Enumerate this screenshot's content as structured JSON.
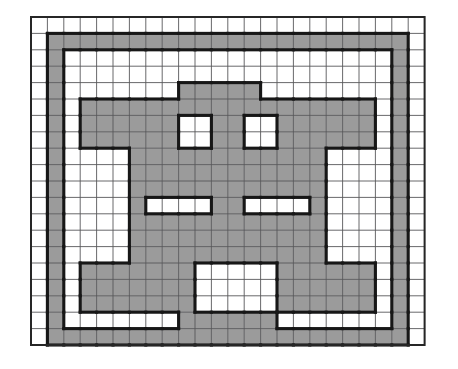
{
  "figure": {
    "type": "grid-shading-puzzle",
    "grid": {
      "columns": 24,
      "rows": 20,
      "cell_size_px": 16.4,
      "origin_x_px": 31,
      "origin_y_px": 17,
      "gridline_color": "#58585a",
      "outer_frame_color": "#262626",
      "outline_color": "#171717",
      "shaded_color": "#9b9b9b",
      "empty_color": "#ffffff",
      "background_color": "#ffffff"
    },
    "shaded_cells": [
      [
        1,
        1
      ],
      [
        2,
        1
      ],
      [
        3,
        1
      ],
      [
        4,
        1
      ],
      [
        5,
        1
      ],
      [
        6,
        1
      ],
      [
        7,
        1
      ],
      [
        8,
        1
      ],
      [
        9,
        1
      ],
      [
        10,
        1
      ],
      [
        11,
        1
      ],
      [
        12,
        1
      ],
      [
        13,
        1
      ],
      [
        14,
        1
      ],
      [
        15,
        1
      ],
      [
        16,
        1
      ],
      [
        17,
        1
      ],
      [
        18,
        1
      ],
      [
        19,
        1
      ],
      [
        20,
        1
      ],
      [
        21,
        1
      ],
      [
        22,
        1
      ],
      [
        1,
        2
      ],
      [
        22,
        2
      ],
      [
        1,
        3
      ],
      [
        22,
        3
      ],
      [
        1,
        4
      ],
      [
        9,
        4
      ],
      [
        10,
        4
      ],
      [
        11,
        4
      ],
      [
        12,
        4
      ],
      [
        13,
        4
      ],
      [
        22,
        4
      ],
      [
        1,
        5
      ],
      [
        3,
        5
      ],
      [
        4,
        5
      ],
      [
        5,
        5
      ],
      [
        6,
        5
      ],
      [
        7,
        5
      ],
      [
        8,
        5
      ],
      [
        9,
        5
      ],
      [
        10,
        5
      ],
      [
        11,
        5
      ],
      [
        12,
        5
      ],
      [
        13,
        5
      ],
      [
        14,
        5
      ],
      [
        15,
        5
      ],
      [
        16,
        5
      ],
      [
        17,
        5
      ],
      [
        18,
        5
      ],
      [
        19,
        5
      ],
      [
        20,
        5
      ],
      [
        22,
        5
      ],
      [
        1,
        6
      ],
      [
        3,
        6
      ],
      [
        4,
        6
      ],
      [
        5,
        6
      ],
      [
        6,
        6
      ],
      [
        7,
        6
      ],
      [
        8,
        6
      ],
      [
        11,
        6
      ],
      [
        12,
        6
      ],
      [
        15,
        6
      ],
      [
        16,
        6
      ],
      [
        17,
        6
      ],
      [
        18,
        6
      ],
      [
        19,
        6
      ],
      [
        20,
        6
      ],
      [
        22,
        6
      ],
      [
        1,
        7
      ],
      [
        3,
        7
      ],
      [
        4,
        7
      ],
      [
        5,
        7
      ],
      [
        6,
        7
      ],
      [
        7,
        7
      ],
      [
        8,
        7
      ],
      [
        11,
        7
      ],
      [
        12,
        7
      ],
      [
        15,
        7
      ],
      [
        16,
        7
      ],
      [
        17,
        7
      ],
      [
        18,
        7
      ],
      [
        19,
        7
      ],
      [
        20,
        7
      ],
      [
        22,
        7
      ],
      [
        1,
        8
      ],
      [
        6,
        8
      ],
      [
        7,
        8
      ],
      [
        8,
        8
      ],
      [
        9,
        8
      ],
      [
        10,
        8
      ],
      [
        11,
        8
      ],
      [
        12,
        8
      ],
      [
        13,
        8
      ],
      [
        14,
        8
      ],
      [
        15,
        8
      ],
      [
        16,
        8
      ],
      [
        17,
        8
      ],
      [
        22,
        8
      ],
      [
        1,
        9
      ],
      [
        6,
        9
      ],
      [
        7,
        9
      ],
      [
        8,
        9
      ],
      [
        9,
        9
      ],
      [
        10,
        9
      ],
      [
        11,
        9
      ],
      [
        12,
        9
      ],
      [
        13,
        9
      ],
      [
        14,
        9
      ],
      [
        15,
        9
      ],
      [
        16,
        9
      ],
      [
        17,
        9
      ],
      [
        22,
        9
      ],
      [
        1,
        10
      ],
      [
        6,
        10
      ],
      [
        7,
        10
      ],
      [
        8,
        10
      ],
      [
        9,
        10
      ],
      [
        10,
        10
      ],
      [
        11,
        10
      ],
      [
        12,
        10
      ],
      [
        13,
        10
      ],
      [
        14,
        10
      ],
      [
        15,
        10
      ],
      [
        16,
        10
      ],
      [
        17,
        10
      ],
      [
        22,
        10
      ],
      [
        1,
        11
      ],
      [
        6,
        11
      ],
      [
        11,
        11
      ],
      [
        12,
        11
      ],
      [
        17,
        11
      ],
      [
        22,
        11
      ],
      [
        1,
        12
      ],
      [
        6,
        12
      ],
      [
        7,
        12
      ],
      [
        8,
        12
      ],
      [
        9,
        12
      ],
      [
        10,
        12
      ],
      [
        11,
        12
      ],
      [
        12,
        12
      ],
      [
        13,
        12
      ],
      [
        14,
        12
      ],
      [
        15,
        12
      ],
      [
        16,
        12
      ],
      [
        17,
        12
      ],
      [
        22,
        12
      ],
      [
        1,
        13
      ],
      [
        6,
        13
      ],
      [
        7,
        13
      ],
      [
        8,
        13
      ],
      [
        9,
        13
      ],
      [
        10,
        13
      ],
      [
        11,
        13
      ],
      [
        12,
        13
      ],
      [
        13,
        13
      ],
      [
        14,
        13
      ],
      [
        15,
        13
      ],
      [
        16,
        13
      ],
      [
        17,
        13
      ],
      [
        22,
        13
      ],
      [
        1,
        14
      ],
      [
        6,
        14
      ],
      [
        7,
        14
      ],
      [
        8,
        14
      ],
      [
        9,
        14
      ],
      [
        10,
        14
      ],
      [
        11,
        14
      ],
      [
        12,
        14
      ],
      [
        13,
        14
      ],
      [
        14,
        14
      ],
      [
        15,
        14
      ],
      [
        16,
        14
      ],
      [
        17,
        14
      ],
      [
        22,
        14
      ],
      [
        1,
        15
      ],
      [
        3,
        15
      ],
      [
        4,
        15
      ],
      [
        5,
        15
      ],
      [
        6,
        15
      ],
      [
        7,
        15
      ],
      [
        8,
        15
      ],
      [
        9,
        15
      ],
      [
        15,
        15
      ],
      [
        16,
        15
      ],
      [
        17,
        15
      ],
      [
        18,
        15
      ],
      [
        19,
        15
      ],
      [
        20,
        15
      ],
      [
        22,
        15
      ],
      [
        1,
        16
      ],
      [
        3,
        16
      ],
      [
        4,
        16
      ],
      [
        5,
        16
      ],
      [
        6,
        16
      ],
      [
        7,
        16
      ],
      [
        8,
        16
      ],
      [
        9,
        16
      ],
      [
        15,
        16
      ],
      [
        16,
        16
      ],
      [
        17,
        16
      ],
      [
        18,
        16
      ],
      [
        19,
        16
      ],
      [
        20,
        16
      ],
      [
        22,
        16
      ],
      [
        1,
        17
      ],
      [
        3,
        17
      ],
      [
        4,
        17
      ],
      [
        5,
        17
      ],
      [
        6,
        17
      ],
      [
        7,
        17
      ],
      [
        8,
        17
      ],
      [
        9,
        17
      ],
      [
        15,
        17
      ],
      [
        16,
        17
      ],
      [
        17,
        17
      ],
      [
        18,
        17
      ],
      [
        19,
        17
      ],
      [
        20,
        17
      ],
      [
        22,
        17
      ],
      [
        1,
        18
      ],
      [
        9,
        18
      ],
      [
        10,
        18
      ],
      [
        11,
        18
      ],
      [
        12,
        18
      ],
      [
        13,
        18
      ],
      [
        14,
        18
      ],
      [
        22,
        18
      ],
      [
        1,
        19
      ],
      [
        2,
        19
      ],
      [
        3,
        19
      ],
      [
        4,
        19
      ],
      [
        5,
        19
      ],
      [
        6,
        19
      ],
      [
        7,
        19
      ],
      [
        8,
        19
      ],
      [
        9,
        19
      ],
      [
        10,
        19
      ],
      [
        11,
        19
      ],
      [
        12,
        19
      ],
      [
        13,
        19
      ],
      [
        14,
        19
      ],
      [
        15,
        19
      ],
      [
        16,
        19
      ],
      [
        17,
        19
      ],
      [
        18,
        19
      ],
      [
        19,
        19
      ],
      [
        20,
        19
      ],
      [
        21,
        19
      ],
      [
        22,
        19
      ]
    ]
  }
}
